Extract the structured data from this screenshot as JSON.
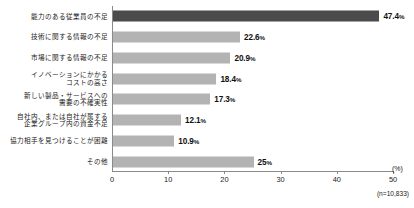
{
  "chart_data": {
    "type": "bar",
    "orientation": "horizontal",
    "title": "",
    "subtitle": "",
    "xlabel": "(%)",
    "ylabel": "",
    "xlim": [
      0,
      50
    ],
    "xticks": [
      0,
      10,
      20,
      30,
      40,
      50
    ],
    "xtick_labels": [
      "0",
      "10",
      "20",
      "30",
      "40",
      "50"
    ],
    "grid": false,
    "legend": false,
    "note": "(n=10,833)",
    "highlight_index": 0,
    "categories": [
      "能力のある従業員の不足",
      "技術に関する情報の不足",
      "市場に関する情報の不足",
      "イノベーションにかかる\nコストの高さ",
      "新しい製品・サービスへの\n需要の不確実性",
      "自社内、または自社が属する\n企業グループ内の資金不足",
      "協力相手を見つけることが困難",
      "その他"
    ],
    "values": [
      47.4,
      22.6,
      20.9,
      18.4,
      17.3,
      12.1,
      10.9,
      25
    ],
    "value_labels": [
      "47.4",
      "22.6",
      "20.9",
      "18.4",
      "17.3",
      "12.1",
      "10.9",
      "25"
    ],
    "value_suffix": "%",
    "colors": {
      "bar": "#b3b3b3",
      "bar_highlight": "#4b4b4b",
      "axis": "#8a8a8a",
      "text": "#1a1a1a"
    }
  }
}
